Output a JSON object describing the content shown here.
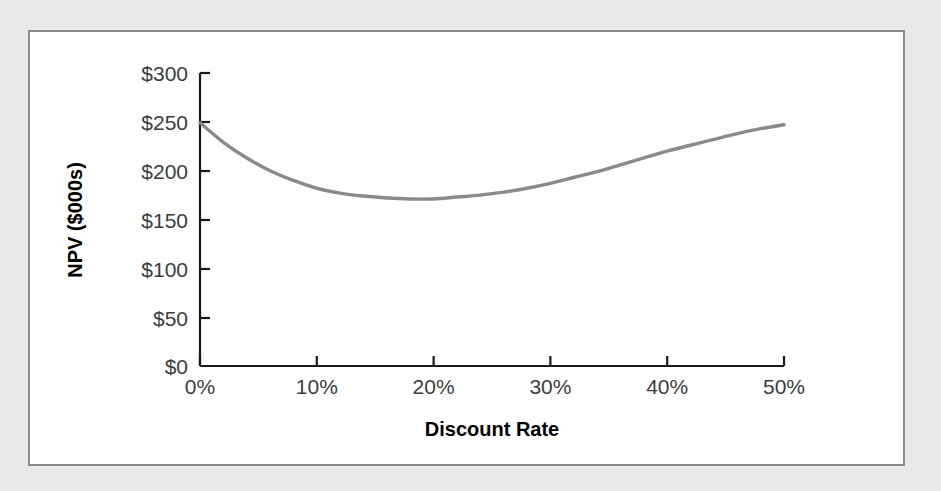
{
  "figure": {
    "panel_background": "#ffffff",
    "page_background": "#e9e9e9",
    "border_color": "#8c8c8c"
  },
  "chart_data": {
    "type": "line",
    "title": "",
    "subtitle": "",
    "xlabel": "Discount Rate",
    "ylabel": "NPV ($000s)",
    "xlim": [
      0,
      50
    ],
    "ylim": [
      0,
      300
    ],
    "grid": false,
    "legend": false,
    "legend_position": "none",
    "line_color": "#8a8a8a",
    "x_tick_labels": [
      "0%",
      "10%",
      "20%",
      "30%",
      "40%",
      "50%"
    ],
    "x_tick_values": [
      0,
      10,
      20,
      30,
      40,
      50
    ],
    "y_tick_labels": [
      "$0",
      "$50",
      "$100",
      "$150",
      "$200",
      "$250",
      "$300"
    ],
    "y_tick_values": [
      0,
      50,
      100,
      150,
      200,
      250,
      300
    ],
    "series": [
      {
        "name": "NPV",
        "x": [
          0,
          2,
          4,
          6,
          8,
          10,
          12,
          14,
          16,
          18,
          20,
          22,
          24,
          26,
          28,
          30,
          32,
          34,
          36,
          38,
          40,
          42,
          44,
          46,
          48,
          50
        ],
        "values": [
          249,
          229,
          213,
          200,
          190,
          182,
          177,
          174,
          172,
          171,
          171,
          173,
          175,
          178,
          182,
          187,
          193,
          199,
          206,
          213,
          220,
          226,
          232,
          238,
          243,
          247
        ]
      }
    ],
    "annotations": []
  },
  "axis": {
    "x_title": "Discount Rate",
    "y_title": "NPV ($000s)"
  }
}
